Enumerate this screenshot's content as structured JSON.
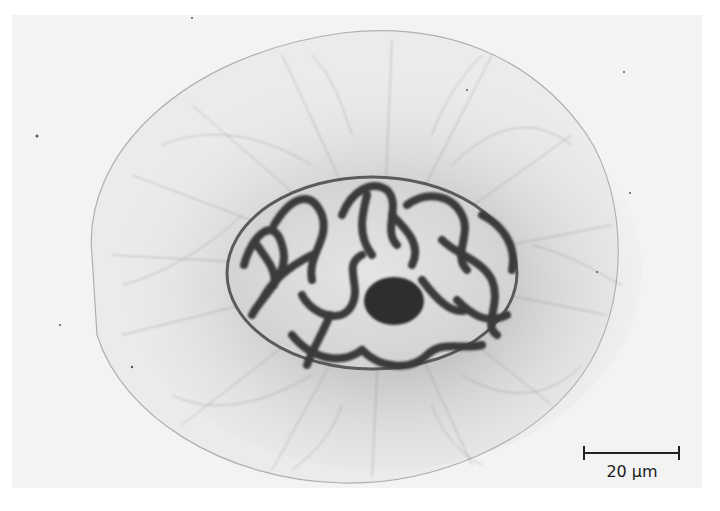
{
  "image": {
    "subject": "light micrograph of a cell with nucleus containing condensed chromosomes and surrounding filament network",
    "background_color": "#f3f3f3",
    "page_color": "#ffffff"
  },
  "scale_bar": {
    "label": "20 µm",
    "value": 20,
    "unit": "µm",
    "color": "#222222"
  },
  "features": [
    {
      "name": "cell-outline",
      "color": "#9a9a9a"
    },
    {
      "name": "filament-network",
      "color": "#6e6e6e"
    },
    {
      "name": "nucleus",
      "color": "#e8e8e8"
    },
    {
      "name": "chromosomes",
      "color": "#3a3a3a"
    },
    {
      "name": "nucleolus",
      "color": "#2e2e2e"
    }
  ]
}
